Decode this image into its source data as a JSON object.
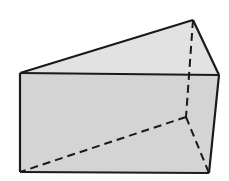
{
  "figure": {
    "type": "triangular-prism",
    "colors": {
      "background": "#ffffff",
      "front_face": "#d4d4d4",
      "top_face": "#e2e2e2",
      "edge": "#1a1a1a"
    },
    "vertices": {
      "front_top_left": [
        20,
        73
      ],
      "front_top_right": [
        219,
        75
      ],
      "back_top": [
        193,
        20
      ],
      "front_bottom_left": [
        20,
        172
      ],
      "front_bottom_right": [
        209,
        173
      ],
      "back_bottom": [
        186,
        117
      ]
    },
    "solid_edges": [
      [
        "front_top_left",
        "front_top_right"
      ],
      [
        "front_top_left",
        "back_top"
      ],
      [
        "back_top",
        "front_top_right"
      ],
      [
        "front_top_left",
        "front_bottom_left"
      ],
      [
        "front_bottom_left",
        "front_bottom_right"
      ],
      [
        "front_top_right",
        "front_bottom_right"
      ]
    ],
    "hidden_edges": [
      [
        "back_top",
        "back_bottom"
      ],
      [
        "back_bottom",
        "front_bottom_left"
      ],
      [
        "back_bottom",
        "front_bottom_right"
      ]
    ]
  }
}
